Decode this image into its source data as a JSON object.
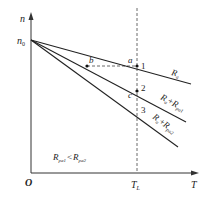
{
  "diagram": {
    "title": "",
    "axes": {
      "y_label": "n",
      "x_label": "T",
      "origin_label": "O",
      "y_intercept_label": "n",
      "y_intercept_sub": "0",
      "x_marker_label": "T",
      "x_marker_sub": "L"
    },
    "lines": [
      {
        "id": "line-ra",
        "label_main": "R",
        "label_sub": "a",
        "label_plus": "",
        "label_main2": "",
        "label_sub2": ""
      },
      {
        "id": "line-ra-rpa1",
        "label_main": "R",
        "label_sub": "a",
        "label_plus": "+",
        "label_main2": "R",
        "label_sub2": "pa1"
      },
      {
        "id": "line-ra-rpa2",
        "label_main": "R",
        "label_sub": "a",
        "label_plus": "+",
        "label_main2": "R",
        "label_sub2": "pa2"
      }
    ],
    "points": {
      "a": "a",
      "b": "b",
      "c": "c",
      "p1": "1",
      "p2": "2",
      "p3": "3"
    },
    "note": {
      "left_main": "R",
      "left_sub": "pa1",
      "relation": "<",
      "right_main": "R",
      "right_sub": "pa2"
    }
  }
}
